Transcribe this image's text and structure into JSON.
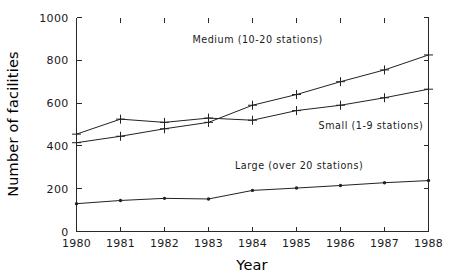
{
  "chart_data": {
    "type": "line",
    "title": "",
    "xlabel": "Year",
    "ylabel": "Number of facilities",
    "x": [
      1980,
      1981,
      1982,
      1983,
      1984,
      1985,
      1986,
      1987,
      1988
    ],
    "xtick_labels": [
      "1980",
      "1981",
      "1982",
      "1983",
      "1984",
      "1985",
      "1986",
      "1987",
      "1988"
    ],
    "ytick_labels": [
      "0",
      "200",
      "400",
      "600",
      "800",
      "1000"
    ],
    "yticks": [
      0,
      200,
      400,
      600,
      800,
      1000
    ],
    "xlim": [
      1980,
      1988
    ],
    "ylim": [
      0,
      1000
    ],
    "grid": false,
    "legend_position": "inline-annotations",
    "series": [
      {
        "name": "Medium (10-20 stations)",
        "label": "Medium (10-20 stations)",
        "marker": "plus",
        "color": "#222222",
        "values": [
          415,
          445,
          480,
          510,
          590,
          640,
          700,
          755,
          825
        ],
        "annotation": {
          "text": "Medium (10-20 stations)",
          "x": 1985.6,
          "y": 880,
          "anchor": "end"
        }
      },
      {
        "name": "Small (1-9 stations)",
        "label": "Small (1-9 stations)",
        "marker": "plus",
        "color": "#222222",
        "values": [
          455,
          525,
          510,
          530,
          520,
          565,
          590,
          625,
          665
        ],
        "annotation": {
          "text": "Small (1-9 stations)",
          "x": 1985.5,
          "y": 480,
          "anchor": "start"
        }
      },
      {
        "name": "Large (over 20 stations)",
        "label": "Large (over 20 stations)",
        "marker": "dot",
        "color": "#222222",
        "values": [
          130,
          145,
          155,
          152,
          192,
          203,
          215,
          228,
          238
        ],
        "annotation": {
          "text": "Large (over 20 stations)",
          "x": 1983.6,
          "y": 290,
          "anchor": "start"
        }
      }
    ]
  }
}
